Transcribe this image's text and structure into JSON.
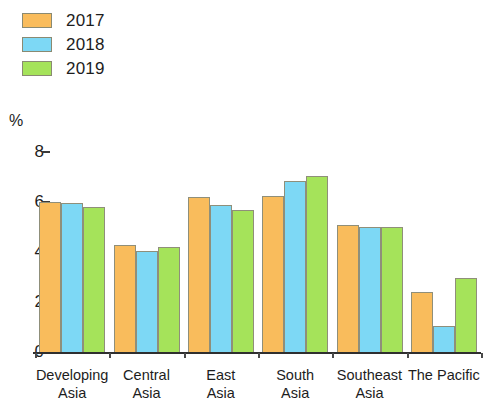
{
  "chart_data": {
    "type": "bar",
    "title": "",
    "subtitle": "",
    "xlabel": "",
    "ylabel": "%",
    "ylim": [
      0,
      8
    ],
    "yticks": [
      0,
      2,
      4,
      6,
      8
    ],
    "ytick_labels": [
      "0",
      "2",
      "4",
      "6",
      "8"
    ],
    "grid": false,
    "legend_position": "top-left",
    "categories": [
      "Developing Asia",
      "Central Asia",
      "East Asia",
      "South Asia",
      "Southeast Asia",
      "The Pacific"
    ],
    "category_lines": [
      [
        "Developing",
        "Asia"
      ],
      [
        "Central",
        "Asia"
      ],
      [
        "East",
        "Asia"
      ],
      [
        "South",
        "Asia"
      ],
      [
        "Southeast",
        "Asia"
      ],
      [
        "The Pacific",
        ""
      ]
    ],
    "series": [
      {
        "name": "2017",
        "color": "#F9BC5C",
        "values": [
          6.0,
          4.3,
          6.2,
          6.25,
          5.1,
          2.4
        ]
      },
      {
        "name": "2018",
        "color": "#7DD8F5",
        "values": [
          5.95,
          4.05,
          5.9,
          6.85,
          5.0,
          1.05
        ]
      },
      {
        "name": "2019",
        "color": "#A5E35A",
        "values": [
          5.8,
          4.2,
          5.7,
          7.05,
          5.0,
          2.95
        ]
      }
    ]
  },
  "legend": {
    "items": [
      {
        "label": "2017",
        "color": "#F9BC5C"
      },
      {
        "label": "2018",
        "color": "#7DD8F5"
      },
      {
        "label": "2019",
        "color": "#A5E35A"
      }
    ]
  },
  "axis": {
    "unit_label": "%"
  }
}
